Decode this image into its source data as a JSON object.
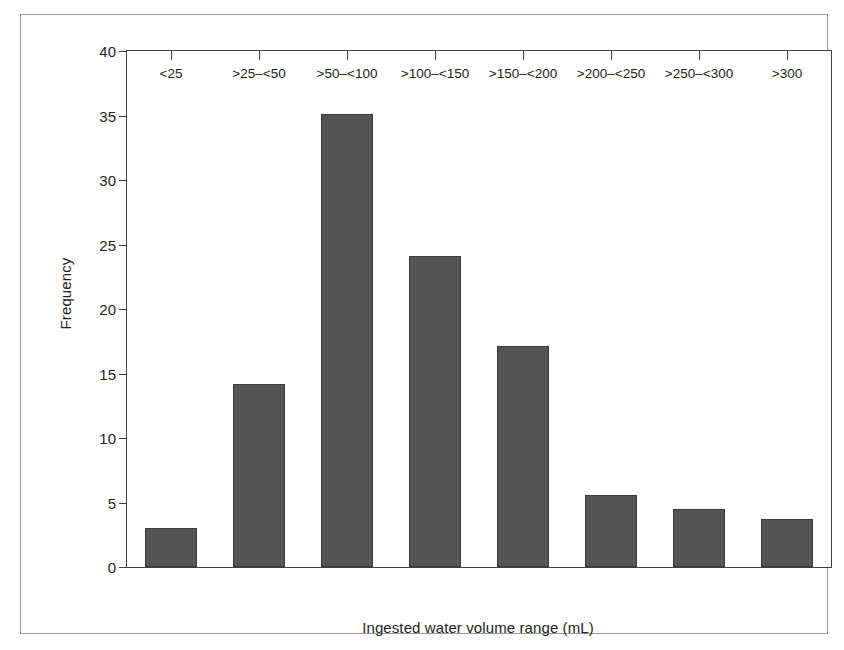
{
  "chart_data": {
    "type": "bar",
    "title": "",
    "xlabel": "Ingested water volume range (mL)",
    "ylabel": "Frequency",
    "categories": [
      "<25",
      ">25–<50",
      ">50–<100",
      ">100–<150",
      ">150–<200",
      ">200–<250",
      ">250–<300",
      ">300"
    ],
    "values": [
      3,
      14.2,
      35.1,
      24.1,
      17.1,
      5.6,
      4.5,
      3.7
    ],
    "ylim": [
      0,
      40
    ],
    "ytick_labels": [
      "0",
      "5",
      "10",
      "15",
      "20",
      "25",
      "30",
      "35",
      "40"
    ],
    "ytick_values": [
      0,
      5,
      10,
      15,
      20,
      25,
      30,
      35,
      40
    ],
    "grid": false,
    "legend": false,
    "bar_color": "#545454",
    "bar_edge_color": "#3b3b3b",
    "axis_color": "#3f3f3f",
    "text_color": "#231f20",
    "background_color": "#ffffff",
    "frame_color": "#9a9a9a"
  }
}
